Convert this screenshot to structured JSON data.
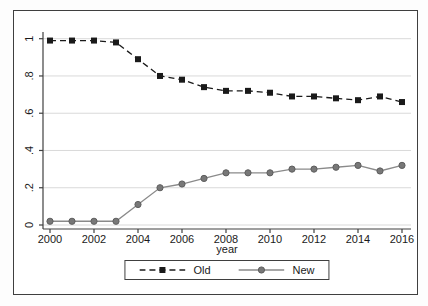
{
  "figure": {
    "background": "#ffffff",
    "border_color": "#3f3f3f",
    "gridline_color": "#d9d9d9",
    "axis_color": "#404040",
    "text_color": "#1a1a1a"
  },
  "chart_data": {
    "type": "line",
    "title": "",
    "xlabel": "year",
    "ylabel": "",
    "x": [
      2000,
      2001,
      2002,
      2003,
      2004,
      2005,
      2006,
      2007,
      2008,
      2009,
      2010,
      2011,
      2012,
      2013,
      2014,
      2015,
      2016
    ],
    "xticks": [
      2000,
      2002,
      2004,
      2006,
      2008,
      2010,
      2012,
      2014,
      2016
    ],
    "yticks": [
      0,
      0.2,
      0.4,
      0.6,
      0.8,
      1
    ],
    "ytick_labels": [
      "0",
      ".2",
      ".4",
      ".6",
      ".8",
      "1"
    ],
    "ylim": [
      0,
      1
    ],
    "grid": "horizontal",
    "legend_position": "bottom-center",
    "series": [
      {
        "name": "Old",
        "line_style": "dashed",
        "marker": "square",
        "color": "#1a1a1a",
        "marker_fill": "#1a1a1a",
        "values": [
          0.99,
          0.99,
          0.99,
          0.98,
          0.89,
          0.8,
          0.78,
          0.74,
          0.72,
          0.72,
          0.71,
          0.69,
          0.69,
          0.68,
          0.67,
          0.69,
          0.66
        ]
      },
      {
        "name": "New",
        "line_style": "solid",
        "marker": "circle",
        "color": "#8a8a8a",
        "marker_fill": "#787878",
        "marker_edge": "#5e5e5e",
        "values": [
          0.02,
          0.02,
          0.02,
          0.02,
          0.11,
          0.2,
          0.22,
          0.25,
          0.28,
          0.28,
          0.28,
          0.3,
          0.3,
          0.31,
          0.32,
          0.29,
          0.32
        ]
      }
    ]
  }
}
